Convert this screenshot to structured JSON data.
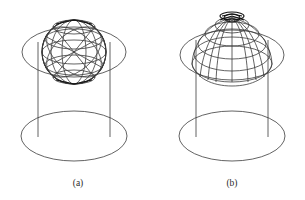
{
  "figure": {
    "background_color": "#ffffff",
    "stroke_color": "#3b3b3b",
    "stroke_color_dark": "#111111",
    "caption_color": "#2b2b2b",
    "panels": [
      {
        "id": "panel-a",
        "label": "(a)",
        "label_x": 78,
        "label_y": 186,
        "view": "orthographic",
        "description": "wireframe sphere on cylinder, flat front view",
        "cylinder": {
          "left_x": 38,
          "right_x": 110,
          "top_y": 30,
          "bottom_y": 155,
          "bottom_ellipse_cx": 74,
          "bottom_ellipse_cy": 136,
          "bottom_ellipse_rx": 53,
          "bottom_ellipse_ry": 25
        },
        "sphere": {
          "cx": 74,
          "cy": 52,
          "r": 32,
          "latitude_count": 5,
          "longitude_count": 6,
          "equator_rx": 52,
          "equator_ry": 26
        }
      },
      {
        "id": "panel-b",
        "label": "(b)",
        "label_x": 232,
        "label_y": 186,
        "view": "perspective",
        "description": "wireframe dome on cylinder, tilted perspective view",
        "cylinder": {
          "left_x": 196,
          "right_x": 268,
          "top_y": 30,
          "bottom_y": 155,
          "bottom_ellipse_cx": 232,
          "bottom_ellipse_cy": 136,
          "bottom_ellipse_rx": 53,
          "bottom_ellipse_ry": 25
        },
        "dome": {
          "cx": 232,
          "cy": 56,
          "r": 32,
          "latitude_count": 5,
          "longitude_count": 8,
          "base_ellipse_rx": 52,
          "base_ellipse_ry": 26
        }
      }
    ]
  }
}
